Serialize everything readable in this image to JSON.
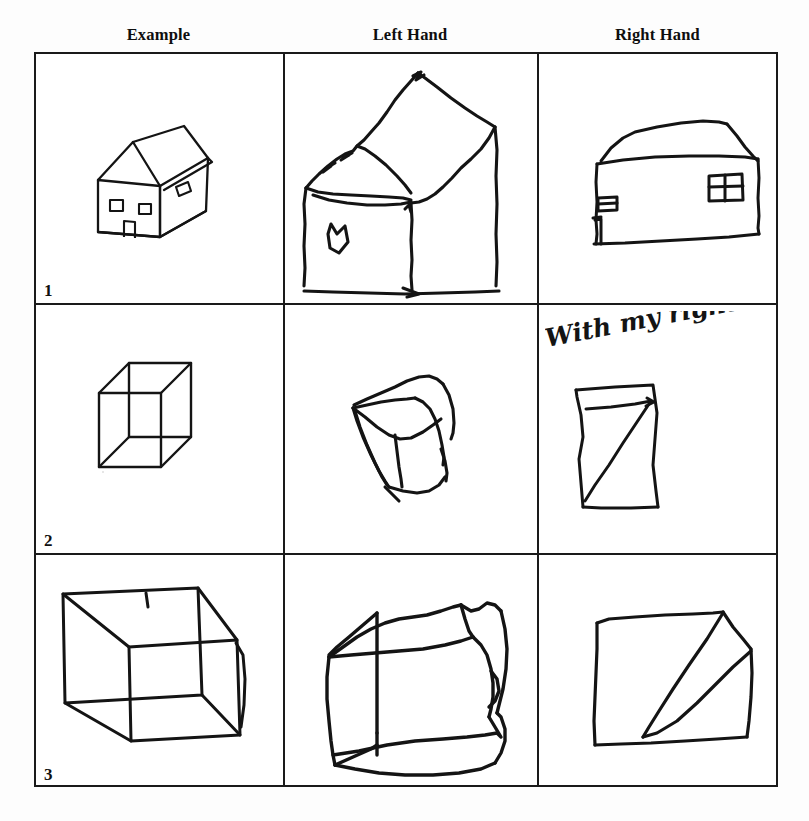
{
  "figure": {
    "title": "",
    "background_color": "#fdfdfd",
    "ink_color": "#111111",
    "grid_line_color": "#1a1a1a"
  },
  "columns": [
    {
      "id": "example",
      "label": "Example"
    },
    {
      "id": "left-hand",
      "label": "Left Hand"
    },
    {
      "id": "right-hand",
      "label": "Right Hand"
    }
  ],
  "rows": [
    {
      "number": "1",
      "subject": "house",
      "cells": [
        {
          "column": "example",
          "drawing": "house-3d-example",
          "description": "Clean three-dimensional house with pitched roof, two square front windows, a door, and one side window"
        },
        {
          "column": "left-hand",
          "drawing": "house-left-hand",
          "description": "Large tremulous house, roof distorted and oversized, single small window"
        },
        {
          "column": "right-hand",
          "drawing": "house-right-hand",
          "description": "Flatter house with sloped roof, two rectangular windows and a narrow door"
        }
      ]
    },
    {
      "number": "2",
      "subject": "cube-small",
      "cells": [
        {
          "column": "example",
          "drawing": "cube-wireframe-small-example",
          "description": "Small transparent wireframe cube drawn in perspective"
        },
        {
          "column": "left-hand",
          "drawing": "cube-left-hand-small",
          "description": "Wobbly cube retaining three-dimensional structure"
        },
        {
          "column": "right-hand",
          "drawing": "cube-right-hand-small",
          "description": "Flat quadrilateral crossed by a single diagonal, three-dimensionality lost",
          "note": "With my right Hand"
        }
      ]
    },
    {
      "number": "3",
      "subject": "cube-large",
      "cells": [
        {
          "column": "example",
          "drawing": "cube-wireframe-large-example",
          "description": "Large transparent wireframe cube, wider than tall"
        },
        {
          "column": "left-hand",
          "drawing": "cube-left-hand-large",
          "description": "Large shaky cube with preserved three-dimensional structure"
        },
        {
          "column": "right-hand",
          "drawing": "cube-right-hand-large",
          "description": "Flat square with two diverging diagonal strokes"
        }
      ]
    }
  ],
  "annotations": {
    "right_hand_cube_note": "With my right Hand"
  }
}
